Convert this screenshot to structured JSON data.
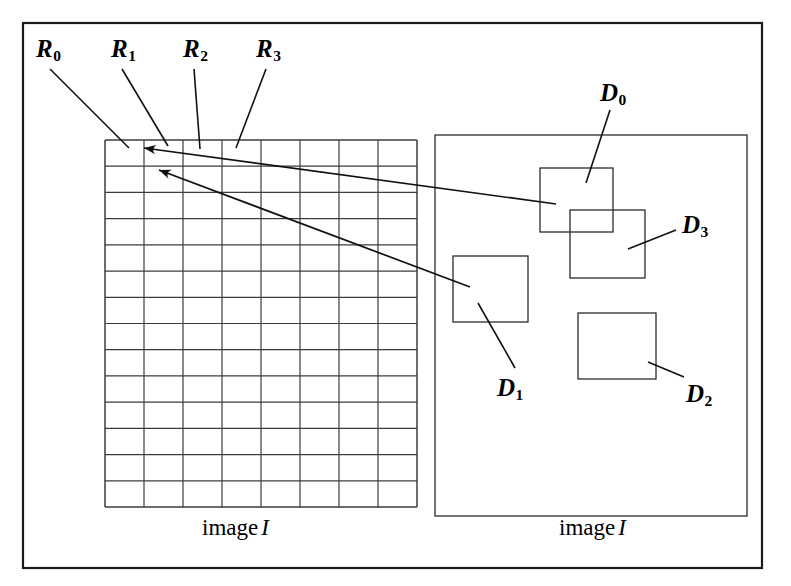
{
  "figure": {
    "width": 791,
    "height": 586,
    "background_color": "#ffffff",
    "stroke_color": "#1a1a1a",
    "grid_stroke_color": "#3c3c3c"
  },
  "left_panel": {
    "caption_text": "image",
    "caption_italic": "I",
    "grid": {
      "columns": 8,
      "rows": 14,
      "x": 105,
      "y": 140,
      "width": 312,
      "height": 367
    },
    "region_labels": [
      {
        "id": "R0",
        "base": "R",
        "sub": "0",
        "x": 36,
        "y": 36
      },
      {
        "id": "R1",
        "base": "R",
        "sub": "1",
        "x": 111,
        "y": 36
      },
      {
        "id": "R2",
        "base": "R",
        "sub": "2",
        "x": 183,
        "y": 36
      },
      {
        "id": "R3",
        "base": "R",
        "sub": "3",
        "x": 256,
        "y": 36
      }
    ],
    "leader_lines": [
      {
        "name": "R0-leader",
        "x1": 50,
        "y1": 69,
        "x2": 129,
        "y2": 148
      },
      {
        "name": "R1-leader",
        "x1": 122,
        "y1": 69,
        "x2": 168,
        "y2": 146
      },
      {
        "name": "R2-leader",
        "x1": 194,
        "y1": 69,
        "x2": 200,
        "y2": 149
      },
      {
        "name": "R3-leader",
        "x1": 266,
        "y1": 69,
        "x2": 236,
        "y2": 148
      }
    ]
  },
  "right_panel": {
    "caption_text": "image",
    "caption_italic": "I",
    "frame": {
      "x": 435,
      "y": 135,
      "width": 312,
      "height": 381
    },
    "detections": [
      {
        "id": "D0",
        "base": "D",
        "sub": "0",
        "box": {
          "x": 540,
          "y": 168,
          "width": 73,
          "height": 64
        },
        "label": {
          "x": 600,
          "y": 80
        },
        "leader": {
          "x1": 610,
          "y1": 110,
          "x2": 586,
          "y2": 183
        }
      },
      {
        "id": "D3",
        "base": "D",
        "sub": "3",
        "box": {
          "x": 570,
          "y": 210,
          "width": 75,
          "height": 68
        },
        "label": {
          "x": 682,
          "y": 212
        },
        "leader": {
          "x1": 676,
          "y1": 230,
          "x2": 628,
          "y2": 249
        }
      },
      {
        "id": "D1",
        "base": "D",
        "sub": "1",
        "box": {
          "x": 453,
          "y": 256,
          "width": 75,
          "height": 66
        },
        "label": {
          "x": 497,
          "y": 375
        },
        "leader": {
          "x1": 515,
          "y1": 368,
          "x2": 478,
          "y2": 303
        }
      },
      {
        "id": "D2",
        "base": "D",
        "sub": "2",
        "box": {
          "x": 578,
          "y": 313,
          "width": 78,
          "height": 66
        },
        "label": {
          "x": 686,
          "y": 381
        },
        "leader": {
          "x1": 684,
          "y1": 377,
          "x2": 648,
          "y2": 362
        }
      }
    ]
  },
  "correspondence_arrows": [
    {
      "name": "arrow-D0-to-R1",
      "from_label": "D0",
      "to_label": "R1",
      "x1": 556,
      "y1": 204,
      "x2": 144,
      "y2": 148
    },
    {
      "name": "arrow-D1-to-R1-lower",
      "from_label": "D1",
      "to_label": "R1",
      "x1": 470,
      "y1": 287,
      "x2": 159,
      "y2": 170
    }
  ],
  "outer_border": {
    "x": 23,
    "y": 23,
    "width": 739,
    "height": 545
  },
  "captions": [
    {
      "name": "left-caption",
      "x": 202,
      "y": 516,
      "text": "image",
      "italic": "I"
    },
    {
      "name": "right-caption",
      "x": 559,
      "y": 516,
      "text": "image",
      "italic": "I"
    }
  ]
}
